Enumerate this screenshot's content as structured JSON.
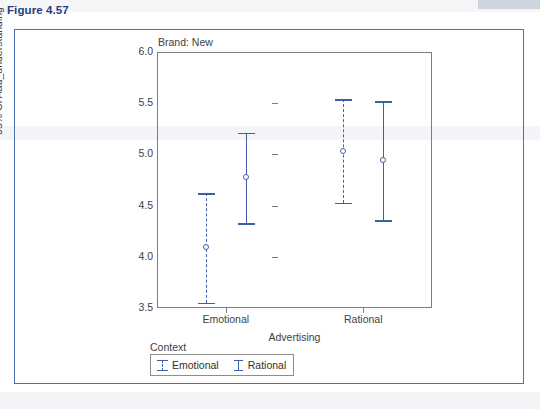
{
  "figure": {
    "label": "Figure 4.57",
    "title_color": "#1f3c88",
    "border_color": "#4a6fbd"
  },
  "chart_data": {
    "type": "scatter",
    "title": "Brand: New",
    "xlabel": "Advertising",
    "ylabel": "95% CI Aad_understanding",
    "ylim": [
      3.5,
      6.0
    ],
    "yticks": [
      "3.5",
      "4.0",
      "4.5",
      "5.0",
      "5.5",
      "6.0"
    ],
    "ytick_values": [
      3.5,
      4.0,
      4.5,
      5.0,
      5.5,
      6.0
    ],
    "categories": [
      "Emotional",
      "Rational"
    ],
    "grid": false,
    "legend_title": "Context",
    "legend_position": "below-left",
    "series": [
      {
        "name": "Emotional",
        "style": "dashed",
        "color": "#3f5fae",
        "points": [
          {
            "x": "Emotional",
            "mean": 4.1,
            "lower": 3.55,
            "upper": 4.62
          },
          {
            "x": "Rational",
            "mean": 5.03,
            "lower": 4.53,
            "upper": 5.54
          }
        ]
      },
      {
        "name": "Rational",
        "style": "solid",
        "color": "#3f5fae",
        "points": [
          {
            "x": "Emotional",
            "mean": 4.78,
            "lower": 4.33,
            "upper": 5.21
          },
          {
            "x": "Rational",
            "mean": 4.95,
            "lower": 4.36,
            "upper": 5.52
          }
        ]
      }
    ]
  },
  "legend": {
    "title": "Context",
    "items": [
      {
        "label": "Emotional",
        "style": "dashed"
      },
      {
        "label": "Rational",
        "style": "solid"
      }
    ]
  }
}
